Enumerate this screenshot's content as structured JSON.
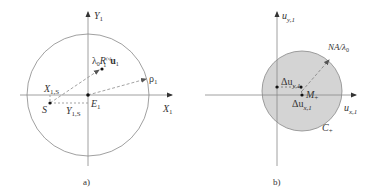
{
  "panels": [
    {
      "id": "a",
      "caption": "a)",
      "axes": {
        "x_label": "X",
        "x_sub": "1",
        "y_label": "Y",
        "y_sub": "1"
      },
      "circle": {
        "filled": false,
        "stroke": "#888888"
      },
      "points": {
        "origin": {
          "label": "E",
          "sub": "1"
        },
        "source": {
          "label": "S"
        },
        "lambda_point": {
          "label_prefix": "λ",
          "label_prefix_sub": "0",
          "label_R": "R",
          "label_R_sub": "1",
          "label_R_sup": "(s)",
          "label_u": "u",
          "label_u_sub": "1"
        },
        "rho_point": {
          "label": "ρ",
          "sub": "1"
        }
      },
      "projections": {
        "x_proj": {
          "label": "X",
          "sub": "1,S"
        },
        "y_proj": {
          "label": "Y",
          "sub": "1,S"
        }
      }
    },
    {
      "id": "b",
      "caption": "b)",
      "axes": {
        "x_label": "u",
        "x_sub": "x,1",
        "y_label": "u",
        "y_sub": "y,1"
      },
      "circle": {
        "filled": true,
        "fill": "#d4d4d4",
        "stroke": "#888888",
        "label": "C",
        "label_sub": "+"
      },
      "points": {
        "center": {
          "label": "M",
          "sub": "+"
        },
        "radius_label": "NA/λ",
        "radius_label_sub": "0"
      },
      "projections": {
        "dy": {
          "label": "Δu",
          "sub": "y,1"
        },
        "dx": {
          "label": "Δu",
          "sub": "x,1"
        }
      }
    }
  ]
}
